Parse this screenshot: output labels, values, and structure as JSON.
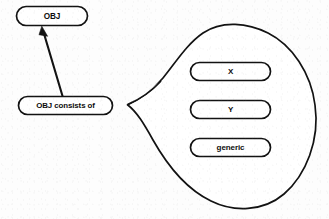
{
  "diagram": {
    "title": "OBJ consists of",
    "background_color": "#fdfdfd",
    "stroke_color": "#121212",
    "fill_color": "#ffffff",
    "nodes": [
      {
        "id": "obj",
        "label": "OBJ",
        "shape": "rounded-rectangle",
        "x": 16,
        "y": 6,
        "width": 72,
        "height": 20
      },
      {
        "id": "obj-consists-of",
        "label": "OBJ consists of",
        "shape": "rounded-rectangle",
        "x": 18,
        "y": 96,
        "width": 95,
        "height": 19
      },
      {
        "id": "x",
        "label": "X",
        "shape": "rounded-rectangle",
        "x": 190,
        "y": 62,
        "width": 81,
        "height": 19
      },
      {
        "id": "y",
        "label": "Y",
        "shape": "rounded-rectangle",
        "x": 190,
        "y": 100,
        "width": 81,
        "height": 19
      },
      {
        "id": "generic",
        "label": "generic",
        "shape": "rounded-rectangle",
        "x": 190,
        "y": 138,
        "width": 81,
        "height": 19
      }
    ],
    "edges": [
      {
        "id": "consists-to-obj",
        "from": "obj-consists-of",
        "to": "obj",
        "arrowhead": "filled-triangle",
        "direction": "up-left"
      }
    ],
    "groups": [
      {
        "id": "member-blob",
        "shape": "teardrop-blob",
        "anchor_from": "obj-consists-of",
        "members": [
          "x",
          "y",
          "generic"
        ],
        "cusp_x": 127,
        "cusp_y": 105
      }
    ]
  }
}
